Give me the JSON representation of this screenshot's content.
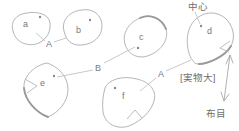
{
  "diagram": {
    "type": "sewing-pattern-pieces",
    "pieces": [
      {
        "id": "a",
        "label": "a",
        "has_center_dot": true
      },
      {
        "id": "b",
        "label": "b",
        "has_center_dot": true
      },
      {
        "id": "c",
        "label": "c",
        "has_center_dot": true
      },
      {
        "id": "d",
        "label": "d",
        "has_center_dot": true,
        "has_notch": true
      },
      {
        "id": "e",
        "label": "e",
        "has_center_dot": true,
        "has_notch": true
      },
      {
        "id": "f",
        "label": "f",
        "has_center_dot": true,
        "has_notch": true
      }
    ],
    "connectors": [
      {
        "label": "A",
        "joins": "a-b"
      },
      {
        "label": "B",
        "joins": "e-c"
      },
      {
        "label": "A",
        "joins": "f-d"
      }
    ],
    "annotations": {
      "center": "中心",
      "actual_size": "[実物大]",
      "grain": "布目"
    },
    "colors": {
      "outline": "#b5b5b5",
      "outline_thick": "#9a9a9a",
      "leader_line": "#c2c2c2",
      "text": "#787878",
      "background": "#ffffff"
    }
  }
}
